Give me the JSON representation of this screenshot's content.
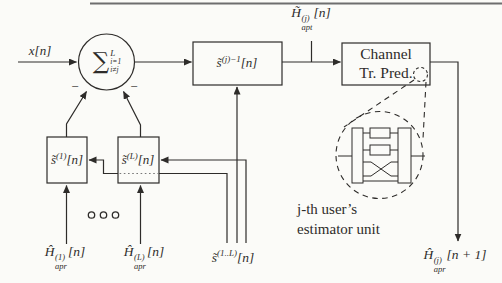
{
  "figure": {
    "type": "block-diagram"
  },
  "colors": {
    "ink": "#2e2c2a",
    "top_rule": "#6e6e6e",
    "background": "#fbfbf8",
    "dotted_line": "#777777"
  },
  "labels": {
    "input": "x[n]",
    "sum": {
      "op": "∑",
      "sup": "L",
      "sub1": "i=1",
      "sub2": "i≠j"
    },
    "minus_left": "−",
    "minus_right": "−",
    "inv_box": {
      "base": "s̃",
      "sup": "(j)−1",
      "arg": "[n]"
    },
    "apt": {
      "base": "H̃",
      "sup": "(j)",
      "sub": "apt",
      "arg": "[n]"
    },
    "channel": {
      "line1": "Channel",
      "line2": "Tr. Pred."
    },
    "s1": {
      "base": "s̃",
      "sup": "(1)",
      "arg": "[n]"
    },
    "sL": {
      "base": "s̃",
      "sup": "(L)",
      "arg": "[n]"
    },
    "apr1": {
      "base": "Ĥ",
      "sup": "(1)",
      "sub": "apr",
      "arg": "[n]"
    },
    "aprL": {
      "base": "Ĥ",
      "sup": "(L)",
      "sub": "apr",
      "arg": "[n]"
    },
    "s_bundle": {
      "base": "s̃",
      "sup": "(1..L)",
      "arg": "[n]"
    },
    "apr_out": {
      "base": "Ĥ",
      "sup": "(j)",
      "sub": "apr",
      "arg": "[n + 1]"
    },
    "note": {
      "line1": "j-th user’s",
      "line2": "estimator unit"
    }
  }
}
